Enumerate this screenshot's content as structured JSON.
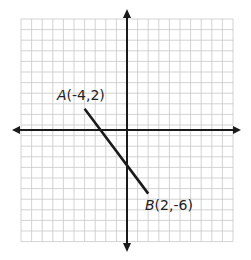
{
  "diagram": {
    "type": "coordinate-plane",
    "grid": {
      "columns": 20,
      "rows": 21,
      "cell_px": 10.6,
      "left": 21,
      "top": 19,
      "color": "#c8c8c8"
    },
    "axes": {
      "origin_px": {
        "x": 127,
        "y": 130
      },
      "color": "#1a1a1a",
      "arrows": true
    },
    "segment": {
      "color": "#1a1a1a",
      "points": [
        {
          "name": "A",
          "x": -4,
          "y": 2,
          "label": "A",
          "coords": "(-4,2)"
        },
        {
          "name": "B",
          "x": 2,
          "y": -6,
          "label": "B",
          "coords": "(2,-6)"
        }
      ]
    }
  }
}
